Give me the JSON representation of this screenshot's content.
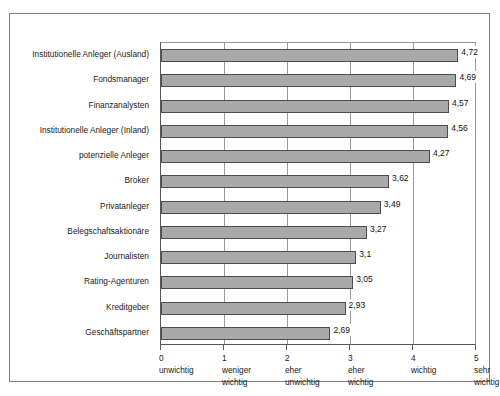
{
  "chart_data": {
    "type": "bar",
    "orientation": "horizontal",
    "title": "",
    "subtitle": "",
    "xlabel": "",
    "ylabel": "",
    "xlim": [
      0,
      5
    ],
    "grid": true,
    "legend": null,
    "decimal_separator": ",",
    "bar_color": "#a9a9a9",
    "bar_border_color": "#4d4d4d",
    "frame_color": "#808080",
    "categories": [
      "Institutionelle Anleger (Ausland)",
      "Fondsmanager",
      "Finanzanalysten",
      "Institutionelle Anleger (Inland)",
      "potenzielle Anleger",
      "Broker",
      "Privatanleger",
      "Belegschaftsaktionäre",
      "Journalisten",
      "Rating-Agenturen",
      "Kreditgeber",
      "Geschäftspartner"
    ],
    "values": [
      4.72,
      4.69,
      4.57,
      4.56,
      4.27,
      3.62,
      3.49,
      3.27,
      3.1,
      3.05,
      2.93,
      2.69
    ],
    "value_labels": [
      "4,72",
      "4,69",
      "4,57",
      "4,56",
      "4,27",
      "3,62",
      "3,49",
      "3,27",
      "3,1",
      "3,05",
      "2,93",
      "2,69"
    ],
    "x_ticks": [
      {
        "value": 0,
        "num": "0",
        "line1": "unwichtig",
        "line2": ""
      },
      {
        "value": 1,
        "num": "1",
        "line1": "weniger",
        "line2": "wichtig"
      },
      {
        "value": 2,
        "num": "2",
        "line1": "eher",
        "line2": "unwichtig"
      },
      {
        "value": 3,
        "num": "3",
        "line1": "eher",
        "line2": "wichtig"
      },
      {
        "value": 4,
        "num": "4",
        "line1": "wichtig",
        "line2": ""
      },
      {
        "value": 5,
        "num": "5",
        "line1": "sehr",
        "line2": "wichtig"
      }
    ]
  }
}
